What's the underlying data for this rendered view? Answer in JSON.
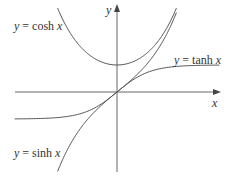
{
  "chart_data": {
    "type": "line",
    "title": "",
    "xlabel": "x",
    "ylabel": "y",
    "grid": false,
    "axes": {
      "x_axis_label": "x",
      "y_axis_label": "y",
      "origin_px": [
        117,
        92
      ]
    },
    "xlim": [
      -3.1,
      3.1
    ],
    "ylim": [
      -3.0,
      3.3
    ],
    "series": [
      {
        "name": "cosh",
        "label": "y = cosh x",
        "function": "cosh(x)",
        "x_range": [
          -1.8,
          1.8
        ],
        "sample_points": [
          [
            -1.8,
            3.11
          ],
          [
            -1,
            1.54
          ],
          [
            0,
            1.0
          ],
          [
            1,
            1.54
          ],
          [
            1.8,
            3.11
          ]
        ]
      },
      {
        "name": "sinh",
        "label": "y = sinh x",
        "function": "sinh(x)",
        "x_range": [
          -1.8,
          1.8
        ],
        "sample_points": [
          [
            -1.8,
            -2.94
          ],
          [
            -1,
            -1.18
          ],
          [
            0,
            0
          ],
          [
            1,
            1.18
          ],
          [
            1.8,
            2.94
          ]
        ]
      },
      {
        "name": "tanh",
        "label": "y = tanh x",
        "function": "tanh(x)",
        "x_range": [
          -3.1,
          3.1
        ],
        "sample_points": [
          [
            -3,
            -0.995
          ],
          [
            -1,
            -0.76
          ],
          [
            0,
            0
          ],
          [
            1,
            0.76
          ],
          [
            3,
            0.995
          ]
        ]
      }
    ],
    "annotations": [
      "y = cosh x",
      "y = tanh x",
      "y = sinh x"
    ]
  },
  "labels": {
    "cosh": {
      "y": "y",
      "eq": " = cosh ",
      "x": "x"
    },
    "tanh": {
      "y": "y",
      "eq": " = tanh ",
      "x": "x"
    },
    "sinh": {
      "y": "y",
      "eq": " = sinh ",
      "x": "x"
    },
    "x_axis": "x",
    "y_axis": "y"
  },
  "colors": {
    "axis": "#555555",
    "curve": "#555555",
    "text": "#333333",
    "background": "#ffffff"
  }
}
